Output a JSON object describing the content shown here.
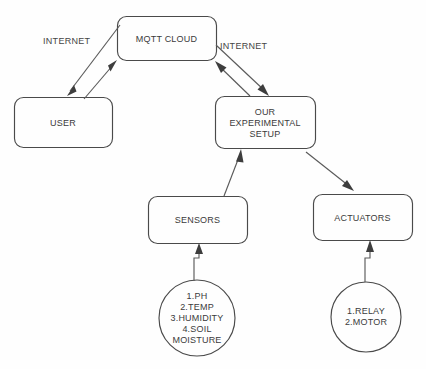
{
  "diagram": {
    "background_color": "#fefefe",
    "stroke_color": "#4a4a4a",
    "text_color": "#3b3b3b",
    "nodes": [
      {
        "id": "mqtt-cloud",
        "shape": "rounded-rect",
        "label": "MQTT CLOUD"
      },
      {
        "id": "user",
        "shape": "rounded-rect",
        "label": "USER"
      },
      {
        "id": "experimental-setup",
        "shape": "rounded-rect",
        "label": "OUR\nEXPERIMENTAL\nSETUP"
      },
      {
        "id": "sensors",
        "shape": "rounded-rect",
        "label": "SENSORS"
      },
      {
        "id": "actuators",
        "shape": "rounded-rect",
        "label": "ACTUATORS"
      },
      {
        "id": "sensor-list",
        "shape": "circle",
        "label": "1.PH\n2.TEMP\n3.HUMIDITY\n4.SOIL\nMOISTURE"
      },
      {
        "id": "actuator-list",
        "shape": "circle",
        "label": "1.RELAY\n2.MOTOR"
      }
    ],
    "edge_labels": [
      {
        "id": "internet-left",
        "label": "INTERNET"
      },
      {
        "id": "internet-right",
        "label": "INTERNET"
      }
    ],
    "connections": [
      {
        "from": "mqtt-cloud",
        "to": "user",
        "type": "bidirectional",
        "label": "INTERNET"
      },
      {
        "from": "mqtt-cloud",
        "to": "experimental-setup",
        "type": "bidirectional",
        "label": "INTERNET"
      },
      {
        "from": "sensors",
        "to": "experimental-setup",
        "type": "directed"
      },
      {
        "from": "experimental-setup",
        "to": "actuators",
        "type": "directed"
      },
      {
        "from": "sensor-list",
        "to": "sensors",
        "type": "directed"
      },
      {
        "from": "actuator-list",
        "to": "actuators",
        "type": "directed"
      }
    ]
  }
}
